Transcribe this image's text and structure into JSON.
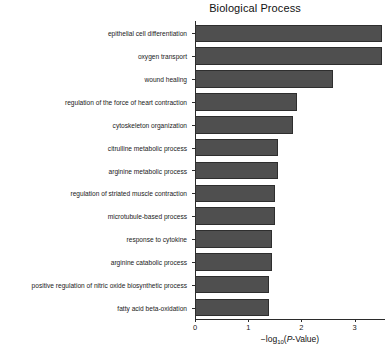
{
  "chart_data": {
    "type": "bar",
    "orientation": "horizontal",
    "title": "Biological Process",
    "xlabel": "-log10(P-Value)",
    "xlabel_parts": {
      "prefix": "−log",
      "subscript": "10",
      "open": "(",
      "italic": "P",
      "suffix": "-Value)"
    },
    "ylabel": "",
    "xlim": [
      0,
      3.57
    ],
    "ylim_count": 13,
    "grid": false,
    "legend": false,
    "xticks": [
      0,
      1,
      2,
      3
    ],
    "xticklabels": [
      "0",
      "1",
      "2",
      "3"
    ],
    "bar_color": "#4f4f4f",
    "bar_edge_color": "#2e2e2e",
    "categories": [
      "epithelial cell differentiation",
      "oxygen transport",
      "wound healing",
      "regulation of the force of heart contraction",
      "cytoskeleton organization",
      "citrulline metabolic process",
      "arginine metabolic process",
      "regulation of striated muscle contraction",
      "microtubule-based process",
      "response to cytokine",
      "arginine catabolic process",
      "positive regulation of nitric oxide biosynthetic process",
      "fatty acid beta-oxidation"
    ],
    "values": [
      3.51,
      3.51,
      2.59,
      1.91,
      1.84,
      1.56,
      1.56,
      1.5,
      1.5,
      1.44,
      1.44,
      1.39,
      1.39
    ]
  }
}
